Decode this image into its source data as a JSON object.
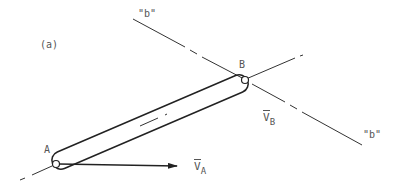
{
  "figure": {
    "panel_label": "(a)",
    "line_b_label_top": "\"b\"",
    "line_b_label_bottom": "\"b\"",
    "point_a_label": "A",
    "point_b_label": "B",
    "velocity_a": {
      "symbol": "V",
      "subscript": "A"
    },
    "velocity_b": {
      "symbol": "V",
      "subscript": "B"
    },
    "colors": {
      "line": "#333333",
      "text": "#555555",
      "background": "#ffffff"
    }
  }
}
